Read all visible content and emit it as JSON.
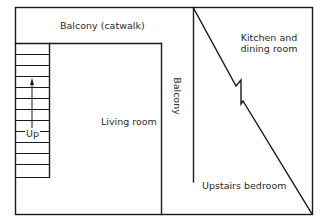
{
  "diagram": {
    "type": "floor-plan",
    "rooms": [
      {
        "id": "balcony-catwalk",
        "label": "Balcony (catwalk)"
      },
      {
        "id": "kitchen-dining",
        "label_line1": "Kitchen and",
        "label_line2": "dining room"
      },
      {
        "id": "living-room",
        "label": "Living room"
      },
      {
        "id": "balcony-side",
        "label": "Balcony"
      },
      {
        "id": "upstairs-bedroom",
        "label": "Upstairs bedroom"
      }
    ],
    "stairs": {
      "label": "Up",
      "tread_count": 12,
      "direction": "up"
    },
    "colors": {
      "line": "#1a1a1a",
      "text": "#2a2a2a",
      "background": "#ffffff"
    }
  }
}
